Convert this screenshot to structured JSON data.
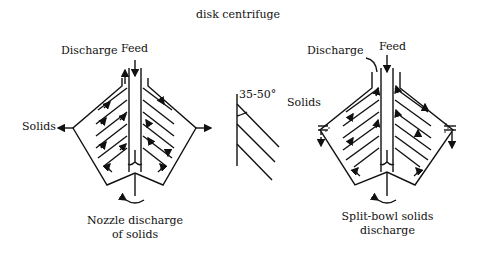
{
  "title": "disk centrifuge",
  "left_diagram": {
    "feed": "Feed",
    "discharge": "Discharge",
    "solids": "Solids",
    "caption_line1": "Nozzle discharge",
    "caption_line2": "of solids"
  },
  "angle_detail": {
    "angle_label": "35-50°"
  },
  "right_diagram": {
    "feed": "Feed",
    "discharge": "Discharge",
    "solids": "Solids",
    "caption_line1": "Split-bowl solids",
    "caption_line2": "discharge"
  }
}
